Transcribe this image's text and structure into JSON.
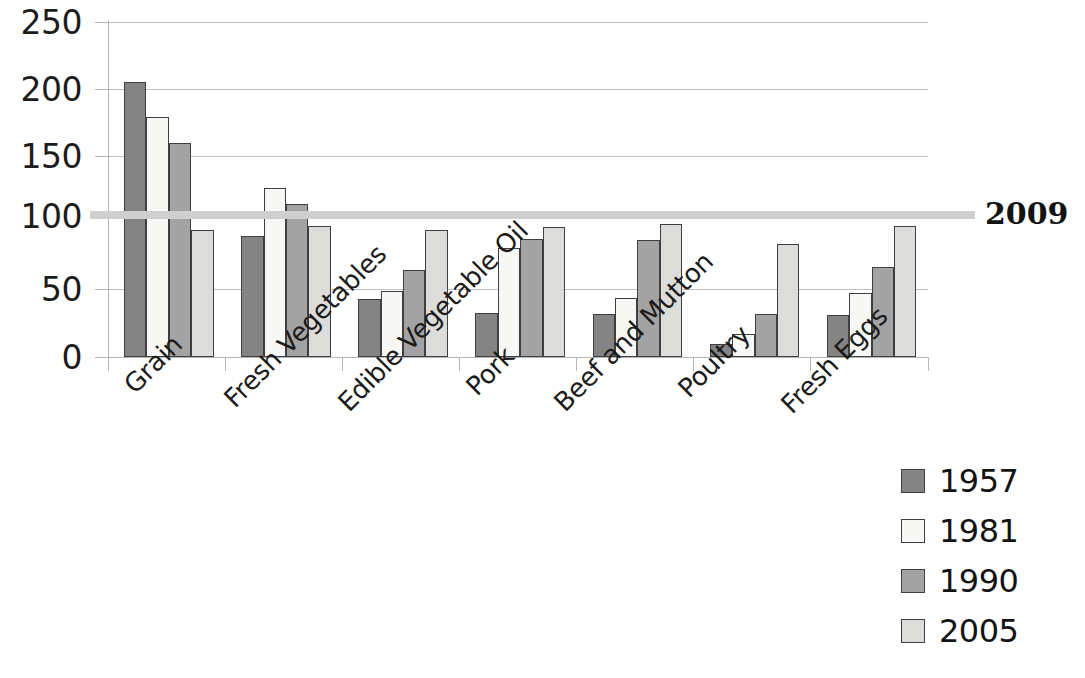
{
  "chart_data": {
    "type": "bar",
    "title": "",
    "subtitle": "",
    "xlabel": "",
    "ylabel": "",
    "grid": true,
    "legend_position": "bottom-right",
    "categories": [
      "Grain",
      "Fresh Vegetables",
      "Edible Vegetable Oil",
      "Pork",
      "Beef and Mutton",
      "Poultry",
      "Fresh Eggs"
    ],
    "series": [
      {
        "name": "1957",
        "color": "#848484",
        "values": [
          205,
          90,
          43,
          33,
          32,
          10,
          31
        ]
      },
      {
        "name": "1981",
        "color": "#f7f7f5",
        "values": [
          179,
          126,
          49,
          81,
          44,
          17,
          48
        ]
      },
      {
        "name": "1990",
        "color": "#a3a3a3",
        "values": [
          160,
          114,
          65,
          88,
          87,
          32,
          67
        ]
      },
      {
        "name": "2005",
        "color": "#dcdcda",
        "values": [
          95,
          98,
          95,
          97,
          99,
          84,
          98
        ]
      }
    ],
    "ylim": [
      0,
      250
    ],
    "yticks": [
      0,
      50,
      100,
      150,
      200,
      250
    ],
    "ytick_labels": [
      "0",
      "50",
      "100",
      "150",
      "200",
      "250"
    ],
    "reference_line": {
      "label": "2009",
      "value": 100,
      "color": "#cfcfcf"
    }
  },
  "legend": {
    "items": [
      {
        "label": "1957"
      },
      {
        "label": "1981"
      },
      {
        "label": "1990"
      },
      {
        "label": "2005"
      }
    ]
  }
}
